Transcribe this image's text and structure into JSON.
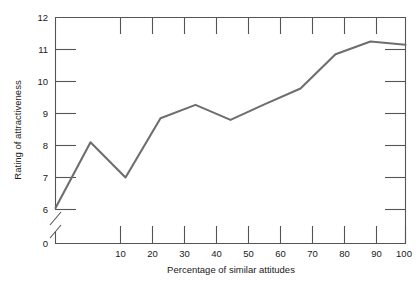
{
  "chart_data": {
    "type": "line",
    "title": "",
    "subtitle": "",
    "xlabel": "Percentage of similar attitudes",
    "ylabel": "Rating of attractiveness",
    "x": [
      0,
      10,
      20,
      30,
      40,
      50,
      60,
      70,
      80,
      90,
      100
    ],
    "values": [
      6.05,
      8.1,
      7.0,
      8.85,
      9.27,
      8.8,
      9.3,
      9.78,
      10.85,
      11.25,
      11.15
    ],
    "series": [
      {
        "name": "Rating of attractiveness",
        "values": [
          6.05,
          8.1,
          7.0,
          8.85,
          9.27,
          8.8,
          9.3,
          9.78,
          10.85,
          11.25,
          11.15
        ]
      }
    ],
    "xlim": [
      0,
      100
    ],
    "ylim": [
      6,
      12
    ],
    "y_axis_break": true,
    "y_break_between": [
      0,
      6
    ],
    "xticks": [
      10,
      20,
      30,
      40,
      50,
      60,
      70,
      80,
      90,
      100
    ],
    "xtick_labels": [
      "10",
      "20",
      "30",
      "40",
      "50",
      "60",
      "70",
      "80",
      "90",
      "100"
    ],
    "yticks": [
      0,
      6,
      7,
      8,
      9,
      10,
      11,
      12
    ],
    "ytick_labels": [
      "0",
      "6",
      "7",
      "8",
      "9",
      "10",
      "11",
      "12"
    ],
    "grid": false,
    "legend": false,
    "legend_position": "none",
    "line_color": "#6e6e6e",
    "axis_color": "#555555",
    "background_color": "#ffffff"
  },
  "axes": {
    "y_title": "Rating of attractiveness",
    "x_title": "Percentage of similar attitudes",
    "y_labels": {
      "t0": "0",
      "t6": "6",
      "t7": "7",
      "t8": "8",
      "t9": "9",
      "t10": "10",
      "t11": "11",
      "t12": "12"
    },
    "x_labels": {
      "t10": "10",
      "t20": "20",
      "t30": "30",
      "t40": "40",
      "t50": "50",
      "t60": "60",
      "t70": "70",
      "t80": "80",
      "t90": "90",
      "t100": "100"
    }
  }
}
